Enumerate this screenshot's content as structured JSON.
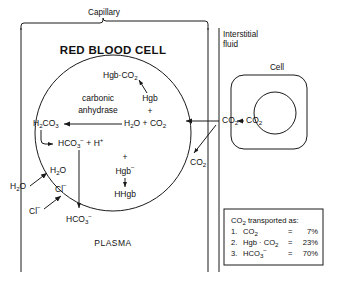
{
  "diagram": {
    "title": "RED BLOOD CELL",
    "regions": {
      "capillary": "Capillary",
      "interstitial_fluid": "Interstitial\nfluid",
      "interstitial_fluid_line1": "Interstitial",
      "interstitial_fluid_line2": "fluid",
      "cell": "Cell",
      "plasma": "PLASMA"
    },
    "enzyme": {
      "line1": "carbonic",
      "line2": "anhydrase"
    },
    "species": {
      "hgb_co2": "Hgb",
      "hgb_co2_dot": "·",
      "hgb_co2_formula": "CO",
      "hgb": "Hgb",
      "plus": "+",
      "water": "H",
      "water_sub": "2",
      "water_tail": "O",
      "co2": "CO",
      "co2_sub": "2",
      "h2co3": "H",
      "h2co3_sub1": "2",
      "h2co3_mid": "CO",
      "h2co3_sub2": "3",
      "hco3": "HCO",
      "hco3_sub": "3",
      "hco3_sup": "−",
      "h_plus": "H",
      "h_plus_sup": "+",
      "hgb_minus": "Hgb",
      "hgb_minus_sup": "−",
      "hhgb": "HHgb",
      "chloride": "Cl",
      "chloride_sup": "−"
    },
    "labels": {
      "h2co3": "H2CO3",
      "hco3_plus_h": "HCO3 + H+",
      "hgb_minus": "Hgb-",
      "hhgb": "HHgb",
      "h2o_inside": "H2O",
      "h2o_outside": "H2O",
      "cl_inside": "Cl-",
      "cl_outside": "Cl-",
      "hco3_plasma": "HCO3-",
      "co2_plasma": "CO2",
      "co2_rbc_edge": "CO2",
      "co2_interstitial": "CO2",
      "co2_cell": "CO2",
      "h2o_plus_co2": "H2O + CO2",
      "hgb_co2": "Hgb-CO2"
    },
    "legend": {
      "title": "CO2 transported as:",
      "title_prefix": "CO",
      "title_sub": "2",
      "title_suffix": " transported as:",
      "rows": [
        {
          "num": "1.",
          "species": "CO2",
          "eq": "=",
          "value": "7%"
        },
        {
          "num": "2.",
          "species": "Hgb · CO2",
          "eq": "=",
          "value": "23%"
        },
        {
          "num": "3.",
          "species": "HCO3-",
          "eq": "=",
          "value": "70%"
        }
      ]
    },
    "colors": {
      "ink": "#1a1a1a",
      "background": "#ffffff"
    }
  }
}
